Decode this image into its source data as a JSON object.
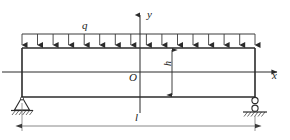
{
  "figure": {
    "type": "engineering-beam-diagram",
    "colors": {
      "line": "#2b2b2b",
      "thin_line": "#555555",
      "background": "#ffffff"
    },
    "labels": {
      "load": "q",
      "axis_y": "y",
      "axis_x": "x",
      "origin": "O",
      "span": "l",
      "height": "h"
    },
    "geometry": {
      "beam_left_x": 22,
      "beam_right_x": 255,
      "beam_top_y": 48,
      "beam_bottom_y": 97,
      "neutral_axis_y": 72,
      "y_axis_x": 140,
      "load_line_y": 34,
      "arrow_count": 16,
      "dimension_line_y": 126,
      "h_dimension_x": 172
    },
    "supports": {
      "left": {
        "kind": "pin-support",
        "x": 22,
        "y": 97
      },
      "right": {
        "kind": "roller-support",
        "x": 255,
        "y": 97
      }
    }
  }
}
